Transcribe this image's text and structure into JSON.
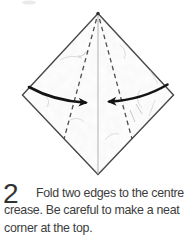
{
  "caption": {
    "step_number": "2",
    "lines": [
      "Fold two edges to the centre",
      "crease. Be careful to make a neat",
      "corner at the top."
    ],
    "full_text": "Fold two edges to the centre crease. Be careful to make a neat corner at the top."
  },
  "colors": {
    "paper_fill": "#ffffff",
    "outline": "#3d3d3d",
    "centre_crease": "#a8a8a8",
    "dashed_fold_line": "#4e4e4e",
    "fold_arrow": "#141414",
    "apex_dot": "#2e2e2e",
    "caption_text": "#3c3c3c"
  }
}
